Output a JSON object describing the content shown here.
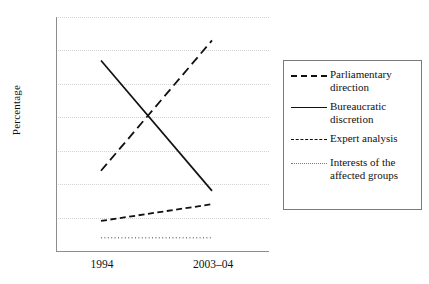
{
  "chart_data": {
    "type": "line",
    "title": "",
    "xlabel": "",
    "ylabel": "Percentage",
    "categories": [
      "1994",
      "2003–04"
    ],
    "x": [
      0,
      1
    ],
    "ylim": [
      0,
      70
    ],
    "yticks": [
      0,
      10,
      20,
      30,
      40,
      50,
      60,
      70
    ],
    "ytick_labels": [
      "0",
      "10",
      "20",
      "30",
      "40",
      "50",
      "60",
      "70"
    ],
    "grid": true,
    "grid_style": "dotted",
    "grid_axis": "y",
    "legend_position": "right",
    "legend_border": true,
    "series": [
      {
        "name": "Parliamentary direction",
        "values": [
          24,
          63
        ],
        "style": "long-dashed",
        "color": "#111111"
      },
      {
        "name": "Bureaucratic discretion",
        "values": [
          57,
          18
        ],
        "style": "solid",
        "color": "#111111"
      },
      {
        "name": "Expert analysis",
        "values": [
          9,
          14
        ],
        "style": "dashed",
        "color": "#111111"
      },
      {
        "name": "Interests of the affected groups",
        "values": [
          4,
          4
        ],
        "style": "dotted",
        "color": "#7d7d7d"
      }
    ]
  },
  "axis": {
    "y_title": "Percentage",
    "y_tick_0": "0",
    "y_tick_10": "10",
    "y_tick_20": "20",
    "y_tick_30": "30",
    "y_tick_40": "40",
    "y_tick_50": "50",
    "y_tick_60": "60",
    "y_tick_70": "70",
    "x_tick_1": "1994",
    "x_tick_2": "2003–04"
  },
  "legend": {
    "items": [
      {
        "label_line1": "Parliamentary",
        "label_line2": "direction"
      },
      {
        "label_line1": "Bureaucratic",
        "label_line2": "discretion"
      },
      {
        "label_line1": "Expert analysis",
        "label_line2": ""
      },
      {
        "label_line1": "Interests of the",
        "label_line2": "affected groups"
      }
    ]
  }
}
